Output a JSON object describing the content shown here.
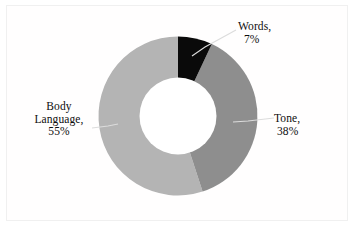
{
  "chart_data": {
    "type": "pie",
    "variant": "doughnut",
    "title": "",
    "subtitle": "",
    "xlabel": "",
    "ylabel": "",
    "categories": [
      "Words",
      "Tone",
      "Body Language"
    ],
    "values": [
      7,
      38,
      55
    ],
    "unit": "%",
    "total": 100,
    "grid": false,
    "legend": "none",
    "labels_position": "outside-with-leader-lines",
    "start_angle_deg": 0,
    "direction": "clockwise",
    "slices": [
      {
        "name": "Words",
        "value": 7,
        "value_text": "7%",
        "label_line1": "Words,",
        "label_line2": "7%",
        "color": "#0a0a0a",
        "start_angle_deg": 0,
        "end_angle_deg": 25.2
      },
      {
        "name": "Tone",
        "value": 38,
        "value_text": "38%",
        "label_line1": "Tone,",
        "label_line2": "38%",
        "color": "#8e8e8e",
        "start_angle_deg": 25.2,
        "end_angle_deg": 162.0
      },
      {
        "name": "Body Language",
        "value": 55,
        "value_text": "55%",
        "label_line1": "Body",
        "label_line2": "Language,",
        "label_line3": "55%",
        "color": "#b4b4b4",
        "start_angle_deg": 162.0,
        "end_angle_deg": 360.0
      }
    ],
    "geometry": {
      "center_x": 178,
      "center_y": 116,
      "outer_radius": 78,
      "inner_radius": 38
    },
    "colors": {
      "words": "#0a0a0a",
      "tone": "#8e8e8e",
      "body_language": "#b4b4b4",
      "hole": "#ffffff",
      "background": "#ffffff",
      "border": "#f0f0f0",
      "leader_line": "#d8d8d8",
      "text": "#0d0d0d"
    }
  }
}
